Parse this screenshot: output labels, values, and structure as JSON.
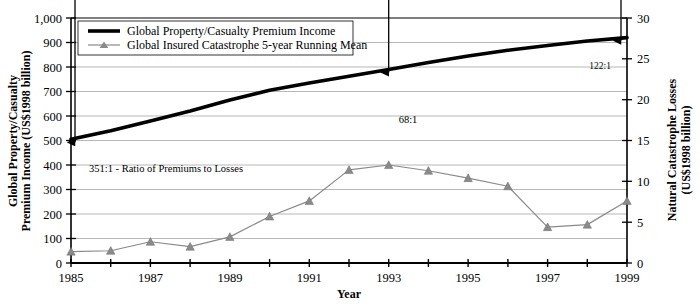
{
  "chart_data": {
    "type": "line",
    "title": "",
    "xlabel": "Year",
    "ylabel": "Global Property/Casualty Premium Income (US$1998 billion)",
    "y2label": "Natural Catastrophe Losses (US$1998 billion)",
    "x": [
      1985,
      1986,
      1987,
      1988,
      1989,
      1990,
      1991,
      1992,
      1993,
      1994,
      1995,
      1996,
      1997,
      1998,
      1999
    ],
    "xlim": [
      1985,
      1999
    ],
    "ylim": [
      0,
      1000
    ],
    "y2lim": [
      0,
      30
    ],
    "grid": true,
    "legend_position": "top-left-inside",
    "xticks": [
      1985,
      1986,
      1987,
      1988,
      1989,
      1990,
      1991,
      1992,
      1993,
      1994,
      1995,
      1996,
      1997,
      1998,
      1999
    ],
    "xtick_labels": [
      "1985",
      "",
      "1987",
      "",
      "1989",
      "",
      "1991",
      "",
      "1993",
      "",
      "1995",
      "",
      "1997",
      "",
      "1999"
    ],
    "yticks": [
      0,
      100,
      200,
      300,
      400,
      500,
      600,
      700,
      800,
      900,
      1000
    ],
    "ytick_labels": [
      "0",
      "100",
      "200",
      "300",
      "400",
      "500",
      "600",
      "700",
      "800",
      "900",
      "1,000"
    ],
    "y2ticks": [
      0,
      5,
      10,
      15,
      20,
      25,
      30
    ],
    "y2tick_labels": [
      "0",
      "5",
      "10",
      "15",
      "20",
      "25",
      "30"
    ],
    "series": [
      {
        "name": "Global Property/Casualty Premium Income",
        "axis": "left",
        "color": "#000000",
        "style": "thick-line",
        "marker": "none",
        "values": [
          505,
          540,
          580,
          620,
          665,
          705,
          735,
          762,
          790,
          818,
          845,
          868,
          888,
          906,
          920
        ]
      },
      {
        "name": "Global Insured Catastrophe 5-year Running Mean",
        "axis": "right",
        "color": "#8a8a8a",
        "style": "thin-line",
        "marker": "triangle",
        "values": [
          1.4,
          1.5,
          2.6,
          2.0,
          3.2,
          5.7,
          7.6,
          11.4,
          12.0,
          11.3,
          10.4,
          9.4,
          4.4,
          4.7,
          7.6
        ]
      }
    ],
    "annotations": [
      {
        "id": "ratio-1985",
        "label": "351:1 - Ratio of Premiums to Losses",
        "x": 1985,
        "from": 505,
        "to": 42,
        "arrow": "double"
      },
      {
        "id": "ratio-1993",
        "label": "68:1",
        "x": 1993,
        "from": 790,
        "to": 400,
        "arrow": "double"
      },
      {
        "id": "ratio-1999",
        "label": "122:1",
        "x": 1999,
        "from": 920,
        "to": 253,
        "arrow": "double"
      }
    ]
  },
  "legend": {
    "items": [
      {
        "label": "Global Property/Casualty Premium Income",
        "swatch": "thick-black-line"
      },
      {
        "label": "Global Insured Catastrophe 5-year Running Mean",
        "swatch": "gray-line-triangle"
      }
    ]
  },
  "axes": {
    "left_title_line1": "Global Property/Casualty",
    "left_title_line2": "Premium Income (US$1998 billion)",
    "right_title_line1": "Natural Catastrophe Losses",
    "right_title_line2": "(US$1998 billion)",
    "x_title": "Year"
  },
  "colors": {
    "premium_line": "#000000",
    "catastrophe_line": "#8a8a8a",
    "gridline": "#9a9a9a",
    "axis": "#000000",
    "background": "#ffffff"
  }
}
